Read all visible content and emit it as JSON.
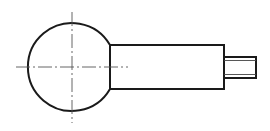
{
  "diagram": {
    "type": "technical-drawing",
    "colors": {
      "background": "#ffffff",
      "outline": "#1a1a1a",
      "centerline": "#555555",
      "thread": "#444444"
    },
    "ball": {
      "cx": 72,
      "cy": 67,
      "r": 44
    },
    "shaft": {
      "x1": 110,
      "y1": 45,
      "x2": 224,
      "y2": 89
    },
    "stub": {
      "x1": 224,
      "y1": 57,
      "x2": 256,
      "y2": 78
    },
    "thread_lines": [
      60,
      75
    ],
    "centerlines": {
      "horizontal": {
        "x1": 16,
        "x2": 128,
        "y": 67
      },
      "vertical": {
        "x": 72,
        "y1": 12,
        "y2": 123
      }
    }
  }
}
